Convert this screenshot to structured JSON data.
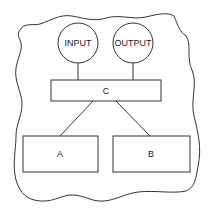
{
  "diagram": {
    "nodes": {
      "input": {
        "label": "INPUT",
        "shape": "circle"
      },
      "output": {
        "label": "OUTPUT",
        "shape": "circle"
      },
      "c": {
        "label": "C",
        "shape": "rectangle"
      },
      "a": {
        "label": "A",
        "shape": "rectangle"
      },
      "b": {
        "label": "B",
        "shape": "rectangle"
      }
    },
    "edges": [
      {
        "from": "INPUT",
        "to": "C"
      },
      {
        "from": "OUTPUT",
        "to": "C"
      },
      {
        "from": "C",
        "to": "A"
      },
      {
        "from": "C",
        "to": "B"
      }
    ],
    "boundary": "system-boundary-cloud",
    "colors": {
      "stroke": "#333333",
      "background": "#ffffff",
      "text": "#222222"
    }
  }
}
